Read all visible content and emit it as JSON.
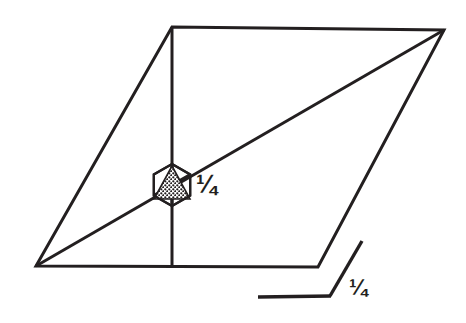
{
  "figure": {
    "background_color": "#ffffff",
    "stroke_color": "#231f20",
    "labels": {
      "center_fraction": "¼",
      "angle_fraction": "¼"
    },
    "shapes": {
      "parallelogram": {
        "name": "parallelogram-outline",
        "points": "172,27 444,30 318,267 36,266",
        "stroke_width": 3
      },
      "vertical_median": {
        "name": "vertical-median-line",
        "x1": 172,
        "y1": 27,
        "x2": 172,
        "y2": 266,
        "stroke_width": 3
      },
      "diagonal": {
        "name": "diagonal-line",
        "x1": 36,
        "y1": 266,
        "x2": 444,
        "y2": 30,
        "stroke_width": 3
      },
      "hexagon": {
        "name": "hexagon-marker",
        "cx": 172,
        "cy": 185,
        "radius": 21,
        "stroke_width": 2.2
      },
      "stippled_triangle": {
        "name": "stippled-triangle",
        "points": "172,167 189,198 155,198",
        "fill_pattern": "dot-stipple",
        "stroke_width": 1.6
      },
      "angle_marker_horizontal": {
        "name": "angle-marker-horizontal-arm",
        "x1": 258,
        "y1": 297,
        "x2": 330,
        "y2": 296,
        "stroke_width": 3.4
      },
      "angle_marker_diagonal": {
        "name": "angle-marker-diagonal-arm",
        "x1": 330,
        "y1": 296,
        "x2": 362,
        "y2": 241,
        "stroke_width": 3.4
      }
    }
  }
}
